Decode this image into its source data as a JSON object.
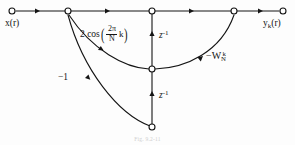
{
  "figure": {
    "type": "signal-flow-graph",
    "caption": "Fig. 9.2-11",
    "background_color": "#fdfdfd",
    "line_color": "#141414",
    "node_fill": "#ffffff"
  },
  "labels": {
    "input": "x",
    "input_arg": "(r)",
    "output": "y",
    "output_sub": "k",
    "output_arg": "(r)",
    "delay_top": "z",
    "delay_top_exp": "-1",
    "delay_bottom": "z",
    "delay_bottom_exp": "-1",
    "feedback_gain_lead": "2 cos",
    "feedback_gain_num": "2π",
    "feedback_gain_den": "N",
    "feedback_gain_k": "k",
    "paren_open": "(",
    "paren_close": ")",
    "negative_one": "−1",
    "twiddle": "−W",
    "twiddle_sub": "N",
    "twiddle_sup": "k"
  },
  "nodes": [
    {
      "id": "input",
      "label": "x(r)",
      "x": 12,
      "y": 11
    },
    {
      "id": "summing-junction",
      "label": "",
      "x": 68,
      "y": 11
    },
    {
      "id": "state-top",
      "label": "",
      "x": 152,
      "y": 11
    },
    {
      "id": "state-mid",
      "label": "",
      "x": 152,
      "y": 69
    },
    {
      "id": "state-bottom",
      "label": "",
      "x": 152,
      "y": 127
    },
    {
      "id": "output-junction",
      "label": "",
      "x": 234,
      "y": 11
    },
    {
      "id": "output",
      "label": "yk(r)",
      "x": 283,
      "y": 11
    }
  ],
  "edges": [
    {
      "from": "input",
      "to": "summing-junction",
      "gain": "1",
      "shape": "straight"
    },
    {
      "from": "summing-junction",
      "to": "state-top",
      "gain": "1",
      "shape": "straight"
    },
    {
      "from": "state-top",
      "to": "output-junction",
      "gain": "1",
      "shape": "straight"
    },
    {
      "from": "output-junction",
      "to": "output",
      "gain": "1",
      "shape": "straight"
    },
    {
      "from": "state-mid",
      "to": "state-top",
      "gain": "z^-1",
      "shape": "straight-up"
    },
    {
      "from": "state-bottom",
      "to": "state-mid",
      "gain": "z^-1",
      "shape": "straight-up"
    },
    {
      "from": "state-mid",
      "to": "summing-junction",
      "gain": "2cos(2pi k/N)",
      "shape": "curve"
    },
    {
      "from": "state-bottom",
      "to": "summing-junction",
      "gain": "-1",
      "shape": "curve"
    },
    {
      "from": "state-mid",
      "to": "output-junction",
      "gain": "-W_N^k",
      "shape": "curve"
    }
  ]
}
